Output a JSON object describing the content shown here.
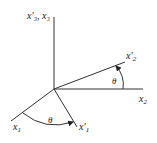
{
  "diagram": {
    "type": "coordinate-rotation",
    "labels": {
      "x3_axis": "x′₃, x₃",
      "x2": "x",
      "x2_sub": "2",
      "x2_prime": "x′",
      "x2_prime_sub": "2",
      "x1": "x",
      "x1_sub": "1",
      "x1_prime": "x′",
      "x1_prime_sub": "1",
      "theta_upper": "θ",
      "theta_lower": "θ"
    },
    "colors": {
      "line": "#333333",
      "background": "#ffffff"
    }
  }
}
